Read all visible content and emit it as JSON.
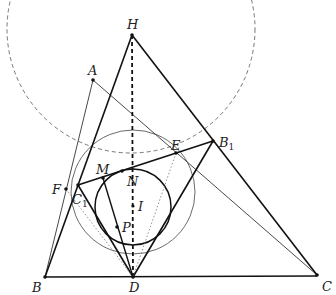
{
  "diagram": {
    "points": {
      "H": {
        "label": "H",
        "x": 132,
        "y": 35
      },
      "A": {
        "label": "A",
        "x": 93,
        "y": 80
      },
      "B": {
        "label": "B",
        "x": 45,
        "y": 277
      },
      "C": {
        "label": "C",
        "x": 317,
        "y": 275
      },
      "D": {
        "label": "D",
        "x": 133,
        "y": 277
      },
      "E": {
        "label": "E",
        "x": 176,
        "y": 153
      },
      "B1": {
        "label": "B",
        "sub": "1",
        "x": 213,
        "y": 141
      },
      "C1": {
        "label": "C",
        "sub": "1",
        "x": 78,
        "y": 185
      },
      "F": {
        "label": "F",
        "x": 66,
        "y": 189
      },
      "M": {
        "label": "M",
        "x": 103,
        "y": 178
      },
      "N": {
        "label": "N",
        "x": 122,
        "y": 171
      },
      "I": {
        "label": "I",
        "x": 133,
        "y": 206
      },
      "P": {
        "label": "P",
        "x": 117,
        "y": 227
      }
    },
    "circles": {
      "incircle": {
        "cx": 133,
        "cy": 207,
        "r": 38
      },
      "thin_circle": {
        "cx": 133,
        "cy": 192,
        "r": 62
      },
      "dashed_circle": {
        "cx": 131,
        "cy": 29,
        "r": 124
      }
    },
    "colors": {
      "stroke": "#111111",
      "thin": "#444444",
      "dashed": "#666666"
    }
  }
}
